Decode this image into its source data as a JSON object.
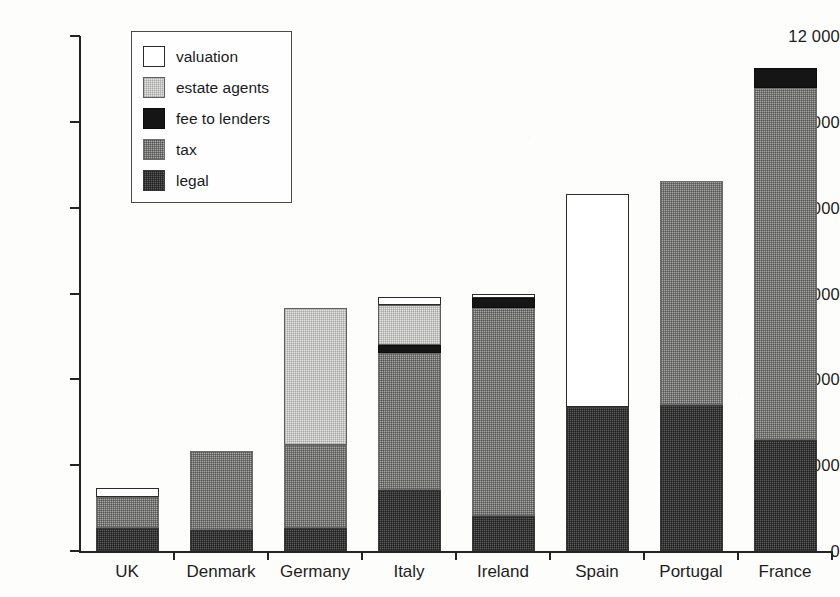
{
  "chart_data": {
    "type": "bar",
    "title": "",
    "subtitle": "",
    "xlabel": "",
    "ylabel": "",
    "stacked": true,
    "grid": false,
    "legend_position": "top-left-inside",
    "ylim": [
      0,
      12000
    ],
    "yticks": [
      0,
      2000,
      4000,
      6000,
      8000,
      10000,
      12000
    ],
    "ytick_labels": [
      "0",
      "2000",
      "4000",
      "6000",
      "8000",
      "10 000",
      "12 000"
    ],
    "categories": [
      "UK",
      "Denmark",
      "Germany",
      "Italy",
      "Ireland",
      "Spain",
      "Portugal",
      "France"
    ],
    "series": [
      {
        "name": "legal",
        "color": "#59595a",
        "values": [
          540,
          490,
          540,
          1420,
          820,
          3350,
          3400,
          2580
        ]
      },
      {
        "name": "tax",
        "color": "#a8a8a6",
        "values": [
          720,
          1840,
          1930,
          3190,
          4840,
          0,
          5220,
          8200
        ]
      },
      {
        "name": "fee to lenders",
        "color": "#151515",
        "values": [
          0,
          0,
          0,
          190,
          230,
          0,
          0,
          470
        ]
      },
      {
        "name": "estate agents",
        "color": "#e3e3e1",
        "values": [
          0,
          0,
          3190,
          930,
          0,
          0,
          0,
          0
        ]
      },
      {
        "name": "valuation",
        "color": "#ffffff",
        "values": [
          210,
          0,
          0,
          190,
          90,
          4960,
          0,
          0
        ]
      }
    ],
    "totals": [
      1470,
      2330,
      5660,
      5920,
      5980,
      8310,
      8620,
      11250
    ]
  },
  "legend": {
    "items": [
      {
        "label": "valuation",
        "swatch": "valuation-swatch"
      },
      {
        "label": "estate agents",
        "swatch": "estate-agents-swatch"
      },
      {
        "label": "fee to lenders",
        "swatch": "fee-to-lenders-swatch"
      },
      {
        "label": "tax",
        "swatch": "tax-swatch"
      },
      {
        "label": "legal",
        "swatch": "legal-swatch"
      }
    ]
  }
}
